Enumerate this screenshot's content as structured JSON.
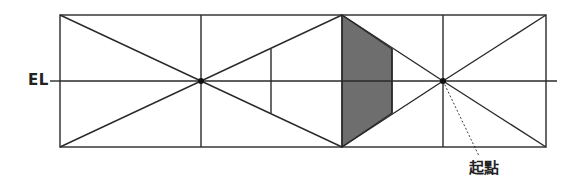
{
  "diagram": {
    "title": "",
    "labels": {
      "eye_level": "EL",
      "start_point": "起點"
    },
    "colors": {
      "line": "#2a2a2a",
      "shade": "#6e6e6e",
      "background": "#ffffff"
    },
    "geometry": {
      "frame": {
        "x1": 60,
        "y1": 15,
        "x2": 546,
        "y2": 147
      },
      "eye_level_y": 81,
      "eye_level_x_end": 557,
      "vanishing_points": [
        {
          "name": "left-center",
          "x": 201,
          "y": 81
        },
        {
          "name": "start-point",
          "x": 443,
          "y": 81
        }
      ],
      "vertical_lines_x": [
        201,
        342,
        443
      ],
      "inner_vertical": {
        "x": 271,
        "y1": 49,
        "y2": 113
      },
      "shaded_polygon": [
        [
          342,
          15
        ],
        [
          392,
          49
        ],
        [
          392,
          113
        ],
        [
          342,
          147
        ]
      ]
    }
  }
}
